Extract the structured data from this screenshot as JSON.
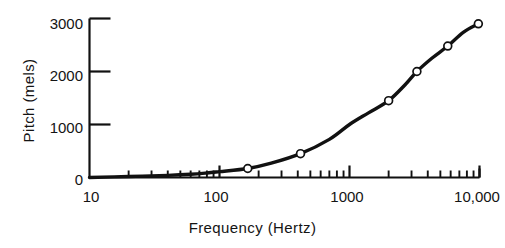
{
  "chart_data": {
    "type": "line",
    "title": "",
    "subtitle": "",
    "xlabel": "Frequency  (Hertz)",
    "ylabel": "Pitch  (mels)",
    "xscale": "log",
    "yscale": "linear",
    "xlim": [
      10,
      10000
    ],
    "ylim": [
      0,
      3000
    ],
    "grid": false,
    "legend": null,
    "x_ticks_major": [
      {
        "value": 10,
        "label": "10"
      },
      {
        "value": 100,
        "label": "100"
      },
      {
        "value": 1000,
        "label": "1000"
      },
      {
        "value": 10000,
        "label": "10,000"
      }
    ],
    "x_ticks_minor": [
      20,
      30,
      40,
      50,
      60,
      70,
      80,
      90,
      200,
      300,
      400,
      500,
      600,
      700,
      800,
      900,
      2000,
      3000,
      4000,
      5000,
      6000,
      7000,
      8000,
      9000
    ],
    "y_ticks_major": [
      {
        "value": 0,
        "label": "0"
      },
      {
        "value": 1000,
        "label": "1000"
      },
      {
        "value": 2000,
        "label": "2000"
      },
      {
        "value": 3000,
        "label": "3000"
      }
    ],
    "series": [
      {
        "name": "Pitch (mel scale)",
        "marker": "open-circle",
        "line_color": "#111111",
        "marker_face_color": "#ffffff",
        "x": [
          10,
          20,
          40,
          60,
          80,
          100,
          165,
          250,
          420,
          700,
          1000,
          1400,
          2000,
          2700,
          3300,
          4300,
          5700,
          7500,
          9800
        ],
        "y": [
          0,
          20,
          40,
          60,
          85,
          110,
          170,
          270,
          450,
          720,
          1000,
          1220,
          1450,
          1760,
          2000,
          2250,
          2480,
          2740,
          2900
        ],
        "data_points": [
          {
            "x": 165,
            "y": 170
          },
          {
            "x": 420,
            "y": 450
          },
          {
            "x": 2000,
            "y": 1450
          },
          {
            "x": 3300,
            "y": 2000
          },
          {
            "x": 5700,
            "y": 2480
          },
          {
            "x": 9800,
            "y": 2900
          }
        ]
      }
    ]
  },
  "axis": {
    "x_title": "Frequency  (Hertz)",
    "y_title": "Pitch  (mels)",
    "x_tick_labels": [
      "10",
      "100",
      "1000",
      "10,000"
    ],
    "y_tick_labels": [
      "0",
      "1000",
      "2000",
      "3000"
    ]
  },
  "colors": {
    "ink": "#111111",
    "background": "#ffffff",
    "marker_fill": "#ffffff"
  }
}
